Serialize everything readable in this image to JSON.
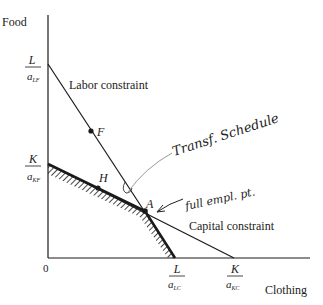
{
  "diagram": {
    "y_axis_label": "Food",
    "x_axis_label": "Clothing",
    "origin_label": "0",
    "y_intercepts": {
      "labor": {
        "num": "L",
        "den": "a",
        "sub": "LF"
      },
      "capital": {
        "num": "K",
        "den": "a",
        "sub": "KF"
      }
    },
    "x_intercepts": {
      "labor": {
        "num": "L",
        "den": "a",
        "sub": "LC"
      },
      "capital": {
        "num": "K",
        "den": "a",
        "sub": "KC"
      }
    },
    "lines": {
      "labor": "Labor constraint",
      "capital": "Capital constraint"
    },
    "points": {
      "F": "F",
      "H": "H",
      "A": "A"
    },
    "annotations": {
      "transformation": "Transf. Schedule",
      "full_employment": "full empl. pt."
    },
    "colors": {
      "ink": "#1a1a1a",
      "pencil": "#9a9a9a"
    }
  }
}
